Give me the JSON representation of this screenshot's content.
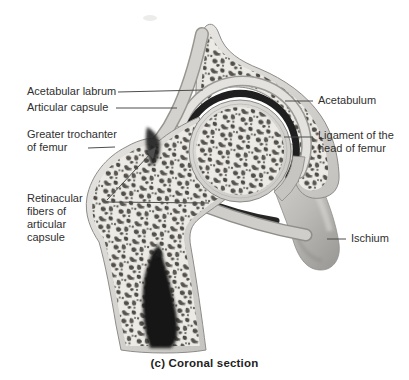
{
  "figure": {
    "caption": "(c) Coronal section",
    "labels": {
      "acetabular_labrum": {
        "lines": [
          "Acetabular labrum"
        ]
      },
      "articular_capsule": {
        "lines": [
          "Articular capsule"
        ]
      },
      "greater_trochanter": {
        "lines": [
          "Greater trochanter",
          "of femur"
        ]
      },
      "retinacular_fibers": {
        "lines": [
          "Retinacular",
          "fibers of",
          "articular",
          "capsule"
        ]
      },
      "acetabulum": {
        "lines": [
          "Acetabulum"
        ]
      },
      "ligament_head_femur": {
        "lines": [
          "Ligament of the",
          "head of femur"
        ]
      },
      "ischium": {
        "lines": [
          "Ischium"
        ]
      }
    },
    "colors": {
      "background": "#ffffff",
      "label_text": "#2f2f2f",
      "leader_line": "#4d4d4d",
      "cortical_bone": "#d6d5d1",
      "trabecular_bg": "#eceae5",
      "trabecular_speckle": "#55524d",
      "smooth_bone": "#b9b8b4",
      "joint_space": "#1f1f1f",
      "medullary_cavity": "#181818"
    }
  }
}
